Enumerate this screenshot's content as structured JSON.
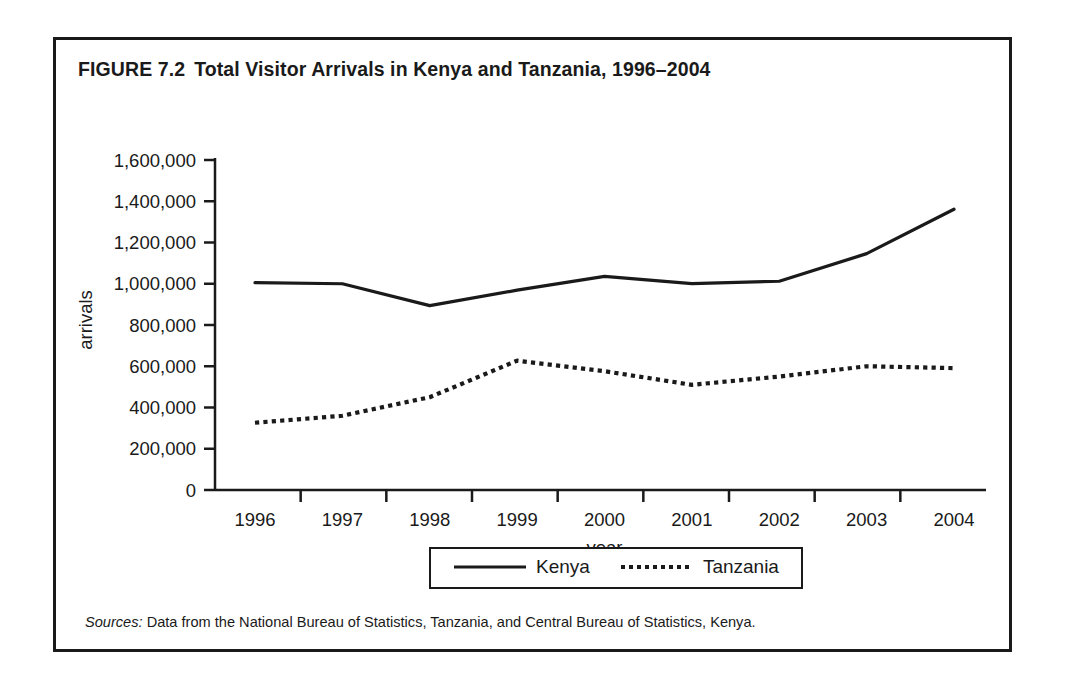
{
  "figure": {
    "number": "FIGURE 7.2",
    "title": "Total Visitor Arrivals in Kenya and Tanzania, 1996–2004",
    "source_prefix": "Sources:",
    "source_text": " Data from the National Bureau of Statistics, Tanzania, and Central Bureau of Statistics, Kenya."
  },
  "legend": {
    "items": [
      {
        "label": "Kenya",
        "style": "solid",
        "color": "#1a1a1a"
      },
      {
        "label": "Tanzania",
        "style": "dotted",
        "color": "#1a1a1a"
      }
    ]
  },
  "chart_data": {
    "type": "line",
    "title": "Total Visitor Arrivals in Kenya and Tanzania, 1996–2004",
    "xlabel": "year",
    "ylabel": "arrivals",
    "categories": [
      "1996",
      "1997",
      "1998",
      "1999",
      "2000",
      "2001",
      "2002",
      "2003",
      "2004"
    ],
    "x": [
      1996,
      1997,
      1998,
      1999,
      2000,
      2001,
      2002,
      2003,
      2004
    ],
    "ylim": [
      0,
      1600000
    ],
    "ytick_values": [
      0,
      200000,
      400000,
      600000,
      800000,
      1000000,
      1200000,
      1400000,
      1600000
    ],
    "ytick_labels": [
      "0",
      "200,000",
      "400,000",
      "600,000",
      "800,000",
      "1,000,000",
      "1,200,000",
      "1,400,000",
      "1,600,000"
    ],
    "grid": false,
    "legend_position": "bottom",
    "series": [
      {
        "name": "Kenya",
        "style": "solid",
        "color": "#1a1a1a",
        "values": [
          1005000,
          1000000,
          894000,
          969000,
          1036000,
          1001000,
          1012000,
          1146000,
          1361000
        ]
      },
      {
        "name": "Tanzania",
        "style": "dotted",
        "color": "#1a1a1a",
        "values": [
          326000,
          360000,
          450000,
          627000,
          576000,
          510000,
          550000,
          600000,
          591000
        ]
      }
    ]
  }
}
